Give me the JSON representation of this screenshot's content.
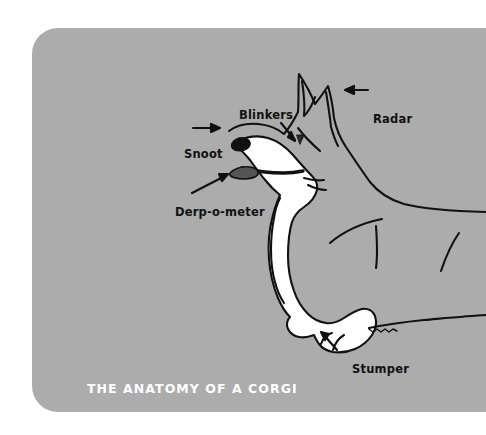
{
  "poster": {
    "title": "THE ANATOMY OF A CORGI",
    "background_color": "#acacac",
    "title_color": "#ffffff",
    "ink_color": "#111111",
    "fill_color": "#ffffff",
    "subject": "corgi-side-view-line-drawing"
  },
  "labels": [
    {
      "id": "blinkers",
      "text": "Blinkers",
      "arrow": "down-right",
      "points_to": "eye"
    },
    {
      "id": "radar",
      "text": "Radar",
      "arrow": "left",
      "points_to": "ear"
    },
    {
      "id": "snoot",
      "text": "Snoot",
      "arrow": "right",
      "points_to": "nose"
    },
    {
      "id": "derp",
      "text": "Derp-o-meter",
      "arrow": "up-right",
      "points_to": "tongue"
    },
    {
      "id": "stumper",
      "text": "Stumper",
      "arrow": "up-left",
      "points_to": "front-paw"
    }
  ]
}
